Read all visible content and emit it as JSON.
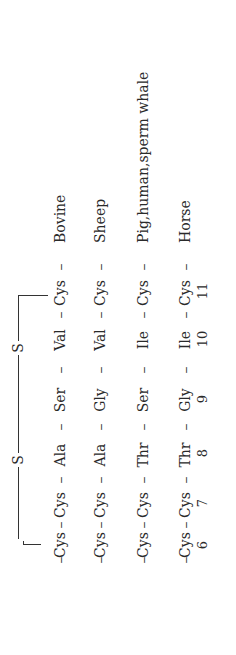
{
  "bridge": {
    "left_atom": "S",
    "right_atom": "S"
  },
  "positions": [
    "6",
    "7",
    "8",
    "9",
    "10",
    "11"
  ],
  "rows": [
    {
      "residues": [
        "Cys",
        "Cys",
        "Ala",
        "Ser",
        "Val",
        "Cys"
      ],
      "species": "Bovine"
    },
    {
      "residues": [
        "Cys",
        "Cys",
        "Ala",
        "Gly",
        "Val",
        "Cys"
      ],
      "species": "Sheep"
    },
    {
      "residues": [
        "Cys",
        "Cys",
        "Thr",
        "Ser",
        "Ile",
        "Cys"
      ],
      "species": "Pig,human,sperm whale"
    },
    {
      "residues": [
        "Cys",
        "Cys",
        "Thr",
        "Gly",
        "Ile",
        "Cys"
      ],
      "species": "Horse"
    }
  ],
  "dash": "–"
}
